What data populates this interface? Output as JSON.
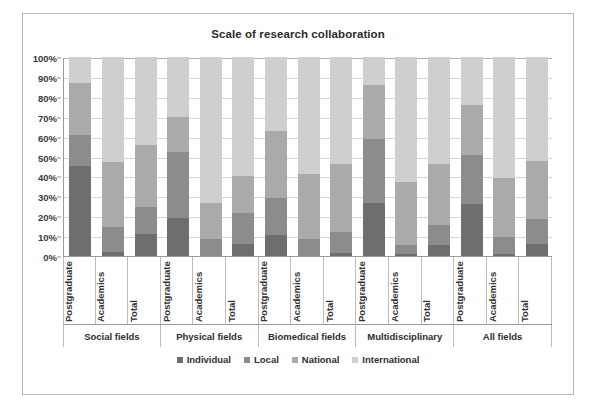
{
  "chart_data": {
    "type": "bar",
    "subtype": "stacked-percent",
    "title": "Scale of research collaboration",
    "xlabel": "",
    "ylabel": "",
    "ylim": [
      0,
      100
    ],
    "ytick_labels": [
      "0%",
      "10%",
      "20%",
      "30%",
      "40%",
      "50%",
      "60%",
      "70%",
      "80%",
      "90%",
      "100%"
    ],
    "ytick_values": [
      0,
      10,
      20,
      30,
      40,
      50,
      60,
      70,
      80,
      90,
      100
    ],
    "grid": true,
    "legend_position": "bottom",
    "legend": [
      "Individual",
      "Local",
      "National",
      "International"
    ],
    "series": [
      {
        "name": "Individual",
        "color": "#6e6e6e",
        "values": [
          45,
          2,
          11,
          19,
          0,
          6,
          10.5,
          0,
          1.5,
          26.5,
          1,
          5.5,
          26,
          1,
          6
        ]
      },
      {
        "name": "Local",
        "color": "#8c8c8c",
        "values": [
          16,
          12.5,
          13.5,
          33.5,
          8.5,
          15.5,
          18.5,
          8.5,
          10.5,
          32.5,
          4.5,
          10,
          25,
          8.5,
          12.5
        ]
      },
      {
        "name": "National",
        "color": "#aaaaaa",
        "values": [
          26,
          32.5,
          31.5,
          17.5,
          18,
          18.5,
          34,
          32.5,
          34,
          27,
          31.5,
          30.5,
          25,
          29.5,
          29
        ]
      },
      {
        "name": "International",
        "color": "#cfcfcf",
        "values": [
          13,
          53,
          44,
          30,
          73.5,
          60,
          37,
          59,
          54,
          14,
          63,
          54,
          24,
          61,
          52.5
        ]
      }
    ],
    "categories": [
      "Postgraduate",
      "Academics",
      "Total",
      "Postgraduate",
      "Academics",
      "Total",
      "Postgraduate",
      "Academics",
      "Total",
      "Postgraduate",
      "Academics",
      "Total",
      "Postgraduate",
      "Academics",
      "Total"
    ],
    "groups": [
      {
        "label": "Social fields",
        "span": 3
      },
      {
        "label": "Physical fields",
        "span": 3
      },
      {
        "label": "Biomedical fields",
        "span": 3
      },
      {
        "label": "Multidisciplinary",
        "span": 3
      },
      {
        "label": "All fields",
        "span": 3
      }
    ],
    "cumulative_tops": [
      {
        "category": "Social fields / Postgraduate",
        "individual": 45,
        "local": 61,
        "national": 87,
        "international": 100
      },
      {
        "category": "Social fields / Academics",
        "individual": 2,
        "local": 14.5,
        "national": 47,
        "international": 100
      },
      {
        "category": "Social fields / Total",
        "individual": 11,
        "local": 24.5,
        "national": 56,
        "international": 100
      },
      {
        "category": "Physical fields / Postgraduate",
        "individual": 19,
        "local": 52.5,
        "national": 70,
        "international": 100
      },
      {
        "category": "Physical fields / Academics",
        "individual": 0,
        "local": 8.5,
        "national": 26.5,
        "international": 100
      },
      {
        "category": "Physical fields / Total",
        "individual": 6,
        "local": 21.5,
        "national": 40,
        "international": 100
      },
      {
        "category": "Biomedical fields / Postgraduate",
        "individual": 10.5,
        "local": 29,
        "national": 63,
        "international": 100
      },
      {
        "category": "Biomedical fields / Academics",
        "individual": 0,
        "local": 8.5,
        "national": 41,
        "international": 100
      },
      {
        "category": "Biomedical fields / Total",
        "individual": 1.5,
        "local": 12,
        "national": 46,
        "international": 100
      },
      {
        "category": "Multidisciplinary / Postgraduate",
        "individual": 26.5,
        "local": 59,
        "national": 86,
        "international": 100
      },
      {
        "category": "Multidisciplinary / Academics",
        "individual": 1,
        "local": 5.5,
        "national": 37,
        "international": 100
      },
      {
        "category": "Multidisciplinary / Total",
        "individual": 5.5,
        "local": 15.5,
        "national": 46,
        "international": 100
      },
      {
        "category": "All fields / Postgraduate",
        "individual": 26,
        "local": 51,
        "national": 76,
        "international": 100
      },
      {
        "category": "All fields / Academics",
        "individual": 1,
        "local": 9.5,
        "national": 39,
        "international": 100
      },
      {
        "category": "All fields / Total",
        "individual": 6,
        "local": 18.5,
        "national": 47.5,
        "international": 100
      }
    ]
  }
}
